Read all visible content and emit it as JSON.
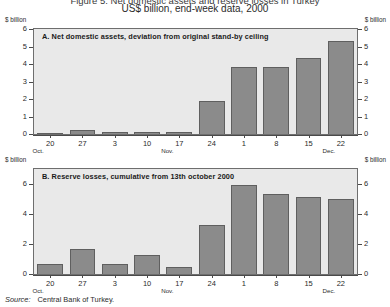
{
  "figure": {
    "title_top": "Figure 5. Net domestic assets and reserve losses in Turkey",
    "subtitle": "US$ billion, end-week data, 2000",
    "unit_label": "$ billion",
    "source_keyword": "Source:",
    "source_value": "Central Bank of Turkey.",
    "bar_color": "#8b8b8b",
    "bar_edge_color": "#5f5f5f",
    "plot_bg": "#e9e9e9",
    "plot_border": "#6e6e6e"
  },
  "panelA": {
    "label": "A.  Net domestic assets, deviation from original stand-by ceiling"
  },
  "panelB": {
    "label": "B.  Reserve losses, cumulative from 13th october 2000"
  },
  "chart_data": [
    {
      "type": "bar",
      "title": "A.  Net domestic assets, deviation from original stand-by ceiling",
      "subtitle": "US$ billion, end-week data, 2000",
      "xlabel": "",
      "ylabel": "$ billion",
      "ylim": [
        0,
        6
      ],
      "yticks": [
        0,
        1,
        2,
        3,
        4,
        5,
        6
      ],
      "ytick_labels": [
        "0",
        "1",
        "2",
        "3",
        "4",
        "5",
        "6"
      ],
      "grid": false,
      "legend": "none",
      "categories": [
        "20",
        "27",
        "3",
        "10",
        "17",
        "24",
        "1",
        "8",
        "15",
        "22"
      ],
      "month_markers": [
        {
          "label": "Oct.",
          "at_category": "20"
        },
        {
          "label": "Nov.",
          "at_category": "17"
        },
        {
          "label": "Dec.",
          "at_category": "22"
        }
      ],
      "values": [
        0.05,
        0.22,
        0.12,
        0.1,
        0.12,
        1.9,
        3.85,
        3.85,
        4.35,
        5.3
      ]
    },
    {
      "type": "bar",
      "title": "B.  Reserve losses, cumulative from 13th october 2000",
      "subtitle": "US$ billion, end-week data, 2000",
      "xlabel": "",
      "ylabel": "$ billion",
      "ylim": [
        0,
        7
      ],
      "yticks": [
        0,
        2,
        4,
        6
      ],
      "ytick_labels": [
        "0",
        "2",
        "4",
        "6"
      ],
      "grid": false,
      "legend": "none",
      "categories": [
        "20",
        "27",
        "3",
        "10",
        "17",
        "24",
        "1",
        "8",
        "15",
        "22"
      ],
      "month_markers": [
        {
          "label": "Oct.",
          "at_category": "20"
        },
        {
          "label": "Nov.",
          "at_category": "17"
        },
        {
          "label": "Dec.",
          "at_category": "22"
        }
      ],
      "values": [
        0.7,
        1.65,
        0.7,
        1.3,
        0.45,
        3.3,
        5.95,
        5.35,
        5.15,
        5.0
      ]
    }
  ]
}
